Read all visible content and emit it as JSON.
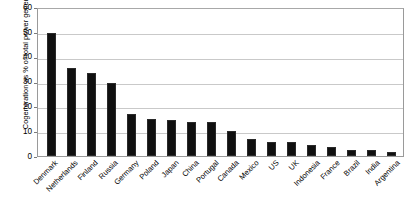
{
  "chart_data": {
    "type": "bar",
    "title": "",
    "xlabel": "",
    "ylabel": "Cogeneration as % of total power generation",
    "ylim": [
      0,
      60
    ],
    "ytick_labels": [
      "60",
      "50",
      "40",
      "30",
      "20",
      "10",
      "0"
    ],
    "ytick_values": [
      60,
      50,
      40,
      30,
      20,
      10,
      0
    ],
    "grid": true,
    "legend": "none",
    "bar_color": "#101010",
    "gridline_color": "#c9c9c9",
    "axis_color": "#9a9a9a",
    "categories": [
      "Denmark",
      "Netherlands",
      "Finland",
      "Russia",
      "Germany",
      "Poland",
      "Japan",
      "China",
      "Portugal",
      "Canada",
      "Mexico",
      "US",
      "UK",
      "Indonesia",
      "France",
      "Brazil",
      "India",
      "Argentina"
    ],
    "values": [
      49.5,
      35.5,
      33.5,
      29.5,
      17.0,
      15.0,
      14.5,
      13.5,
      13.5,
      10.0,
      7.0,
      5.5,
      5.5,
      4.5,
      3.5,
      2.5,
      2.5,
      1.5
    ]
  },
  "figure": {
    "title_sliver": "",
    "axis_title_y": "Cogeneration as % of total power generation"
  }
}
